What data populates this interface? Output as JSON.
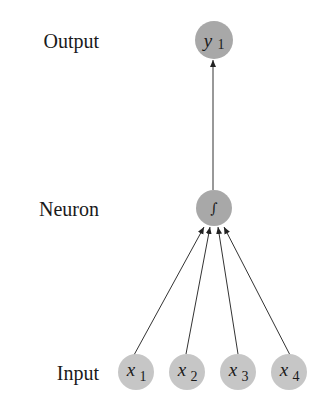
{
  "colors": {
    "background": "#ffffff",
    "input_node_fill": "#c6c6c6",
    "neuron_node_fill": "#a8a8a8",
    "output_node_fill": "#a8a8a8",
    "edge": "#333333",
    "text": "#1a1a1a"
  },
  "layers": {
    "output": {
      "label": "Output"
    },
    "neuron": {
      "label": "Neuron"
    },
    "input": {
      "label": "Input"
    }
  },
  "nodes": {
    "output": [
      {
        "var": "y",
        "sub": "1"
      }
    ],
    "neuron": [
      {
        "symbol": "∫"
      }
    ],
    "input": [
      {
        "var": "x",
        "sub": "1"
      },
      {
        "var": "x",
        "sub": "2"
      },
      {
        "var": "x",
        "sub": "3"
      },
      {
        "var": "x",
        "sub": "4"
      }
    ]
  },
  "edges": [
    {
      "from": "x1",
      "to": "neuron"
    },
    {
      "from": "x2",
      "to": "neuron"
    },
    {
      "from": "x3",
      "to": "neuron"
    },
    {
      "from": "x4",
      "to": "neuron"
    },
    {
      "from": "neuron",
      "to": "y1"
    }
  ]
}
